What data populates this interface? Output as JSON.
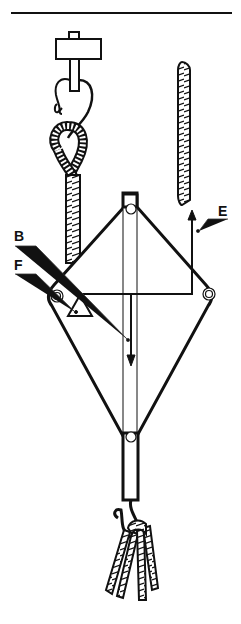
{
  "figure": {
    "type": "mechanical diagram",
    "labels": {
      "B": "B",
      "E": "E",
      "F": "F"
    },
    "colors": {
      "line": "#111111",
      "background": "#ffffff"
    }
  }
}
